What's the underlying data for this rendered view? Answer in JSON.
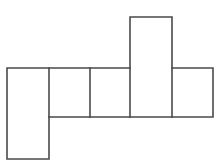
{
  "figure": {
    "title": "",
    "background_color": "#ffffff",
    "stroke_color": "#4a4a4a",
    "fill_color": "#ffffff",
    "stroke_width": 1.6,
    "canvas": {
      "width": 221,
      "height": 164
    }
  },
  "chart_data": {
    "type": "diagram",
    "title": "",
    "xlabel": "",
    "ylabel": "",
    "units": "pixels",
    "xlim": [
      0,
      221
    ],
    "ylim": [
      0,
      164
    ],
    "grid": false,
    "legend": null,
    "shape_kind": "polyomino-net",
    "face_count": 6,
    "faces": [
      {
        "name": "left-flap",
        "x": 7,
        "y": 68,
        "width": 42,
        "height": 91,
        "label": ""
      },
      {
        "name": "strip-cell-1",
        "x": 49,
        "y": 68,
        "width": 41,
        "height": 49,
        "label": ""
      },
      {
        "name": "strip-cell-2",
        "x": 90,
        "y": 68,
        "width": 40,
        "height": 49,
        "label": ""
      },
      {
        "name": "center-tall",
        "x": 130,
        "y": 17,
        "width": 42,
        "height": 100,
        "label": ""
      },
      {
        "name": "right-cell",
        "x": 172,
        "y": 68,
        "width": 41,
        "height": 49,
        "label": ""
      }
    ],
    "outline_points": [
      [
        7,
        68
      ],
      [
        130,
        68
      ],
      [
        130,
        17
      ],
      [
        172,
        17
      ],
      [
        172,
        68
      ],
      [
        213,
        68
      ],
      [
        213,
        117
      ],
      [
        49,
        117
      ],
      [
        49,
        159
      ],
      [
        7,
        159
      ]
    ],
    "interior_segments": [
      {
        "name": "divider-1",
        "x1": 49,
        "y1": 68,
        "x2": 49,
        "y2": 117
      },
      {
        "name": "divider-2",
        "x1": 90,
        "y1": 68,
        "x2": 90,
        "y2": 117
      },
      {
        "name": "divider-3",
        "x1": 130,
        "y1": 68,
        "x2": 130,
        "y2": 117
      },
      {
        "name": "divider-4",
        "x1": 172,
        "y1": 68,
        "x2": 172,
        "y2": 117
      }
    ]
  }
}
